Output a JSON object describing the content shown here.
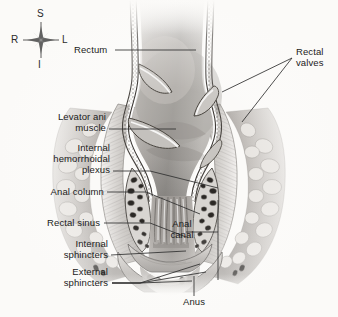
{
  "figure": {
    "background_color": "#fbfaf8",
    "width": 338,
    "height": 317,
    "line_color": "#2f2f2f",
    "text_color": "#1b1b1b"
  },
  "orientation_compass": {
    "name": "anatomical-orientation-rose",
    "superior": "S",
    "inferior": "I",
    "right": "R",
    "left": "L"
  },
  "labels": {
    "rectum": "Rectum",
    "rectal_valves": "Rectal\nvalves",
    "levator_ani_muscle": "Levator ani\nmuscle",
    "internal_hemorrhoidal_plexus": "Internal\nhemorrhoidal\nplexus",
    "anal_column": "Anal column",
    "rectal_sinus": "Rectal sinus",
    "internal_sphincters": "Internal\nsphincters",
    "external_sphincters": "External\nsphincters",
    "anal_canal": "Anal\ncanal",
    "anus": "Anus"
  },
  "structures": [
    {
      "id": "rectum",
      "label": "Rectum",
      "description": "Wide terminal segment of large intestine above the anal canal"
    },
    {
      "id": "rectal-valves",
      "label": "Rectal valves",
      "description": "Transverse semilunar folds projecting into the rectal lumen"
    },
    {
      "id": "levator-ani-muscle",
      "label": "Levator ani muscle",
      "description": "Pelvic floor muscle sling lateral to the rectum"
    },
    {
      "id": "internal-hemorrhoidal-plexus",
      "label": "Internal hemorrhoidal plexus",
      "description": "Venous sinusoids in the submucosa of the anal canal"
    },
    {
      "id": "anal-column",
      "label": "Anal column",
      "description": "Vertical mucosal ridges of the upper anal canal"
    },
    {
      "id": "rectal-sinus",
      "label": "Rectal sinus",
      "description": "Recess between adjacent anal columns"
    },
    {
      "id": "internal-sphincters",
      "label": "Internal sphincters",
      "description": "Involuntary smooth muscle ring of the anal canal"
    },
    {
      "id": "external-sphincters",
      "label": "External sphincters",
      "description": "Voluntary skeletal muscle bundles surrounding the anus"
    },
    {
      "id": "anal-canal",
      "label": "Anal canal",
      "description": "Terminal segment extending from rectum to anus"
    },
    {
      "id": "anus",
      "label": "Anus",
      "description": "External opening of the alimentary canal"
    }
  ]
}
